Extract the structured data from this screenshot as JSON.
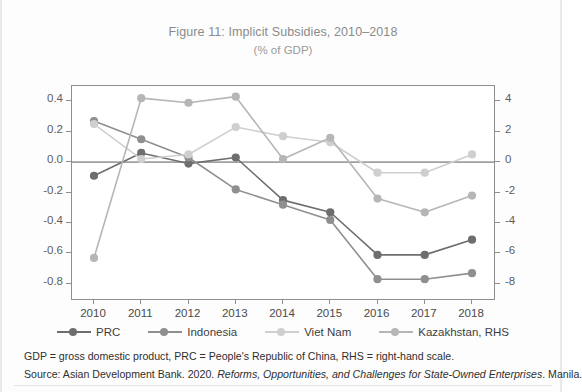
{
  "figure": {
    "title": "Figure 11: Implicit Subsidies, 2010–2018",
    "subtitle": "(% of GDP)"
  },
  "notes": {
    "abbreviations": "GDP = gross domestic product, PRC = People's Republic of China, RHS = right-hand scale.",
    "source_prefix": "Source: Asian Development Bank. 2020. ",
    "source_italic": "Reforms, Opportunities, and Challenges for State-Owned Enterprises",
    "source_suffix": ". Manila."
  },
  "colors": {
    "prc": "#6e6e6e",
    "indonesia": "#8f8f8f",
    "viet_nam": "#cfcfcf",
    "kazakhstan": "#b6b6b6",
    "axis": "#8e8e8e",
    "zero_line": "#5a5a5a"
  },
  "chart_data": {
    "type": "line",
    "title": "Figure 11: Implicit Subsidies, 2010–2018",
    "subtitle": "(% of GDP)",
    "xlabel": "",
    "ylabel": "",
    "grid": false,
    "legend_position": "bottom",
    "categories": [
      "2010",
      "2011",
      "2012",
      "2013",
      "2014",
      "2015",
      "2016",
      "2017",
      "2018"
    ],
    "x_tick_labels": [
      "2010",
      "2011",
      "2012",
      "2013",
      "2014",
      "2015",
      "2016",
      "2017",
      "2018"
    ],
    "left_axis": {
      "label": "",
      "ylim": [
        -0.9,
        0.5
      ],
      "ticks": [
        0.4,
        0.2,
        0.0,
        -0.2,
        -0.4,
        -0.6,
        -0.8
      ],
      "tick_labels": [
        "0.4",
        "0.2",
        "0.0",
        "-0.2",
        "-0.4",
        "-0.6",
        "-0.8"
      ]
    },
    "right_axis": {
      "label": "",
      "ylim": [
        -9.0,
        5.0
      ],
      "ticks": [
        4,
        2,
        0,
        -2,
        -4,
        -6,
        -8
      ],
      "tick_labels": [
        "4",
        "2",
        "0",
        "-2",
        "-4",
        "-6",
        "-8"
      ]
    },
    "series": [
      {
        "name": "PRC",
        "axis": "left",
        "color": "#6e6e6e",
        "values": [
          -0.09,
          0.06,
          -0.01,
          0.03,
          -0.25,
          -0.33,
          -0.61,
          -0.61,
          -0.51
        ]
      },
      {
        "name": "Indonesia",
        "axis": "left",
        "color": "#8f8f8f",
        "values": [
          0.27,
          0.15,
          0.03,
          -0.18,
          -0.28,
          -0.38,
          -0.77,
          -0.77,
          -0.73
        ]
      },
      {
        "name": "Viet Nam",
        "axis": "left",
        "color": "#cfcfcf",
        "values": [
          0.25,
          0.02,
          0.05,
          0.23,
          0.17,
          0.13,
          -0.07,
          -0.07,
          0.05
        ]
      },
      {
        "name": "Kazakhstan, RHS",
        "axis": "right",
        "color": "#b6b6b6",
        "values": [
          -6.3,
          4.2,
          3.9,
          4.3,
          0.2,
          1.6,
          -2.4,
          -3.3,
          -2.2
        ]
      }
    ]
  }
}
